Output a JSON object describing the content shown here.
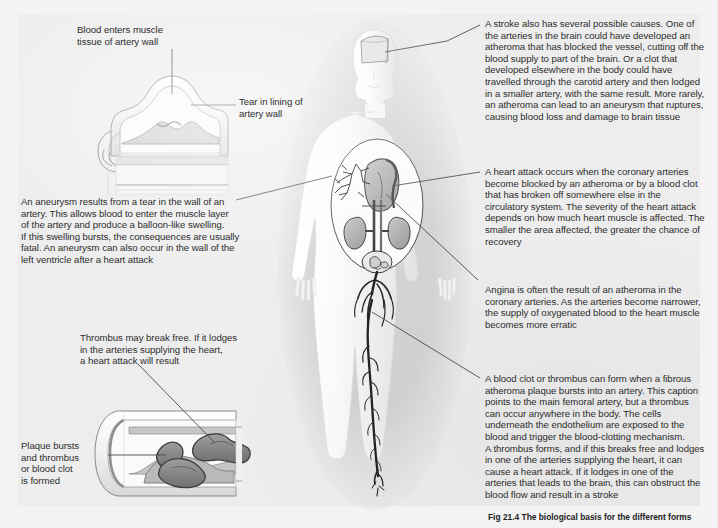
{
  "figure": {
    "caption_label": "Fig 21.4",
    "caption_text": "The biological basis for the different forms"
  },
  "colors": {
    "page_background": "#f3f3f3",
    "plate_background": "#ededed",
    "text": "#2d2d2d",
    "leader_line": "#4a4a4a",
    "body_silhouette": "#c9c9c9",
    "body_fill": "#f7f7f7",
    "organ_fill": "#b5b5b5",
    "organ_stroke": "#3a3a3a",
    "artery_dark": "#2e2e2e",
    "vessel_wall": "#c0c0c0",
    "clot_fill": "#8d8d8d"
  },
  "annotations": {
    "blood_enters": {
      "name": "blood-enters-muscle-tissue",
      "text": "Blood enters muscle\ntissue of artery wall",
      "x": 77,
      "y": 24,
      "width": 150
    },
    "tear_in_lining": {
      "name": "tear-in-lining-of-artery-wall",
      "text": "Tear in lining of\nartery wall",
      "x": 239,
      "y": 96,
      "width": 120
    },
    "aneurysm": {
      "name": "aneurysm-description",
      "text": "An aneurysm results from a tear in the wall of an\nartery. This allows blood to enter the muscle layer\nof the artery and produce a balloon-like swelling.\nIf this swelling bursts, the consequences are usually\nfatal. An aneurysm can also occur in the wall of the\nleft ventricle after a heart attack",
      "x": 21,
      "y": 196,
      "width": 262
    },
    "thrombus_break_free": {
      "name": "thrombus-may-break-free",
      "text": "Thrombus may break free.  If it lodges\nin the arteries supplying the heart,\na heart attack will result",
      "x": 80,
      "y": 332,
      "width": 240
    },
    "plaque_bursts": {
      "name": "plaque-bursts-and-thrombus",
      "text": "Plaque bursts\nand thrombus\nor blood clot\nis formed",
      "x": 21,
      "y": 440,
      "width": 88
    },
    "stroke": {
      "name": "stroke-description",
      "text": "A stroke also has several possible causes. One of\nthe arteries in the brain could have developed an\natheroma that has blocked the vessel, cutting off the\nblood supply to part of the brain. Or a clot that\ndeveloped elsewhere in the body could have\ntravelled through the carotid artery and then lodged\nin a smaller artery, with the same result. More rarely,\nan atheroma can lead to an aneurysm that ruptures,\ncausing blood loss and damage to brain tissue",
      "x": 485,
      "y": 18,
      "width": 232
    },
    "heart_attack": {
      "name": "heart-attack-description",
      "text": "A heart attack occurs when the coronary arteries\nbecome blocked by an atheroma or by a blood clot\nthat has broken off somewhere else in the\ncirculatory system. The severity of the heart attack\ndepends on how much heart muscle is affected. The\nsmaller the area affected, the greater the chance of\nrecovery",
      "x": 485,
      "y": 166,
      "width": 232
    },
    "angina": {
      "name": "angina-description",
      "text": "Angina is often the result of an atheroma in the\ncoronary arteries. As the arteries become narrower,\nthe supply of oxygenated blood to the heart muscle\nbecomes more erratic",
      "x": 485,
      "y": 284,
      "width": 232
    },
    "thrombus": {
      "name": "thrombus-description",
      "text": "A blood clot or thrombus can form when a fibrous\natheroma plaque bursts into an artery. This caption\npoints to the main femoral artery, but a thrombus\ncan occur anywhere in the body. The cells\nunderneath the endothelium are exposed to the\nblood and trigger the blood-clotting mechanism.\nA thrombus forms, and if this breaks free and lodges\nin one of the arteries supplying the heart, it can\ncause a heart attack. If it lodges in one of the\narteries that leads to the brain, this can obstruct the\nblood flow and result in a stroke",
      "x": 485,
      "y": 373,
      "width": 232
    }
  },
  "illustrations": {
    "aneurysm_diagram": {
      "name": "aneurysm-artery-cross-section"
    },
    "thrombus_diagram": {
      "name": "thrombus-artery-cross-section"
    },
    "body_figure": {
      "name": "human-body-anatomy-figure"
    }
  }
}
